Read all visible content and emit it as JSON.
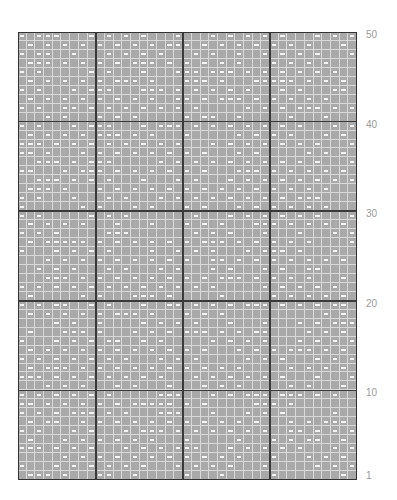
{
  "chart": {
    "columns": 39,
    "rows": 50,
    "column_groups": [
      9,
      10,
      10,
      10
    ],
    "row_group_size": 10,
    "colors": {
      "cell": "#a9a9a9",
      "minor_grid": "#d9d9d9",
      "major_grid": "#3a3a3a",
      "symbol": "#f4f4f4",
      "label": "#9a9a9a"
    },
    "symbol_legend": {
      "empty": "knit (gray square)",
      "dash": "purl (white dash)"
    }
  },
  "row_labels": [
    {
      "text": "50",
      "y": 30
    },
    {
      "text": "40",
      "y": 120
    },
    {
      "text": "30",
      "y": 209
    },
    {
      "text": "20",
      "y": 299
    },
    {
      "text": "10",
      "y": 388
    },
    {
      "text": "1",
      "y": 471
    }
  ]
}
